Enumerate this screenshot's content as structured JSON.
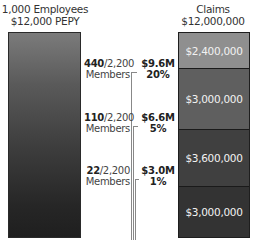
{
  "left": {
    "title_line1": "1,000 Employees",
    "title_line2": "$12,000 PEPY"
  },
  "right": {
    "title_line1": "Claims",
    "title_line2": "$12,000,000",
    "segments": [
      {
        "label": "$2,400,000",
        "color": "#8f8f8f"
      },
      {
        "label": "$3,000,000",
        "color": "#5f5f5f"
      },
      {
        "label": "$3,600,000",
        "color": "#404040"
      },
      {
        "label": "$3,000,000",
        "color": "#333333"
      }
    ]
  },
  "tiers": [
    {
      "members_bold": "440",
      "members_rest": "/2,200",
      "members_label": "Members",
      "amount": "$9.6M",
      "percent": "20%"
    },
    {
      "members_bold": "110",
      "members_rest": "/2,200",
      "members_label": "Members",
      "amount": "$6.6M",
      "percent": "5%"
    },
    {
      "members_bold": "22",
      "members_rest": "/2,200",
      "members_label": "Members",
      "amount": "$3.0M",
      "percent": "1%"
    }
  ]
}
